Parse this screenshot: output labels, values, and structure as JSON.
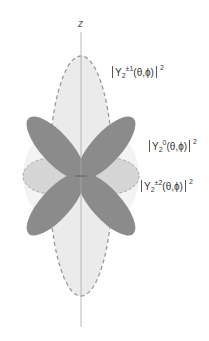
{
  "figure": {
    "axis": {
      "label": "z"
    },
    "colors": {
      "background": "#ffffff",
      "axis_line": "#a8a8a8",
      "y21_fill": "#ececec",
      "y21_stroke": "#9a9a9a",
      "y20_fill": "#8a8a8a",
      "y22_fill": "#d4d4d4",
      "y22_stroke": "#a0a0a0",
      "halo_fill": "#f2f2f2"
    },
    "labels": [
      {
        "id": "y2-pm1",
        "base": "Y",
        "subscript": "2",
        "superscript": "±1",
        "args": "(θ,ϕ)",
        "power": "2"
      },
      {
        "id": "y2-0",
        "base": "Y",
        "subscript": "2",
        "superscript": "0",
        "args": "(θ,ϕ)",
        "power": "2"
      },
      {
        "id": "y2-pm2",
        "base": "Y",
        "subscript": "2",
        "superscript": "±2",
        "args": "(θ,ϕ)",
        "power": "2"
      }
    ]
  }
}
